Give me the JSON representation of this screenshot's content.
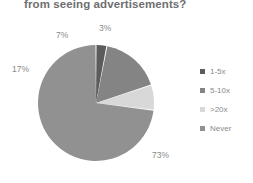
{
  "chart_data": {
    "type": "pie",
    "title": "from seeing advertisements?",
    "xlabel": "",
    "ylabel": "",
    "legend_position": "right",
    "grid": false,
    "categories": [
      "1-5x",
      "5-10x",
      ">20x",
      "Never"
    ],
    "values": [
      3,
      17,
      7,
      73
    ],
    "value_labels": [
      "3%",
      "17%",
      "7%",
      "73%"
    ],
    "colors": [
      "#5c5c5c",
      "#848484",
      "#d8d8d8",
      "#919191"
    ],
    "slices": [
      {
        "label": "1-5x",
        "value": 3,
        "value_label": "3%",
        "color": "#5c5c5c"
      },
      {
        "label": "5-10x",
        "value": 17,
        "value_label": "17%",
        "color": "#848484"
      },
      {
        "label": ">20x",
        "value": 7,
        "value_label": "7%",
        "color": "#d8d8d8"
      },
      {
        "label": "Never",
        "value": 73,
        "value_label": "73%",
        "color": "#919191"
      }
    ]
  },
  "legend": {
    "items": [
      {
        "label": "1-5x",
        "color": "#5c5c5c"
      },
      {
        "label": "5-10x",
        "color": "#848484"
      },
      {
        "label": ">20x",
        "color": "#d8d8d8"
      },
      {
        "label": "Never",
        "color": "#919191"
      }
    ]
  }
}
